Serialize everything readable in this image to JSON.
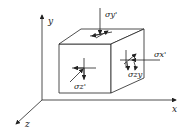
{
  "diagram": {
    "axes": {
      "x": "x",
      "y": "y",
      "z": "z"
    },
    "labels": {
      "sigma_y": "σy'",
      "sigma_x": "σx'",
      "sigma_z": "σz'",
      "tau": "σzy"
    },
    "colors": {
      "line": "#222222",
      "background": "#ffffff"
    }
  }
}
